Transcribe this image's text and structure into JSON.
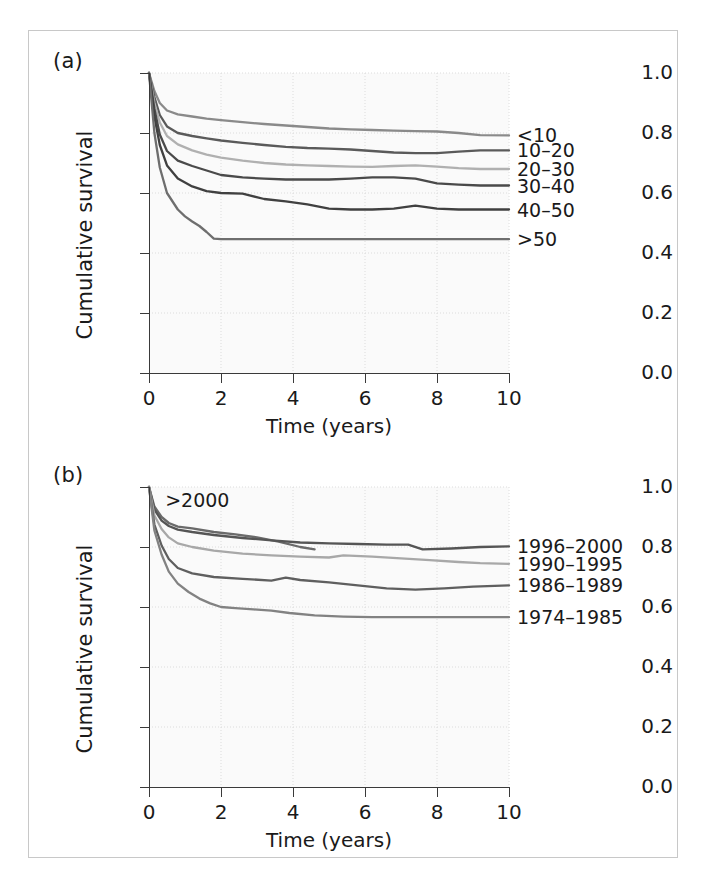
{
  "figure": {
    "panel_a_label": "(a)",
    "panel_b_label": "(b)"
  },
  "axes": {
    "xlabel": "Time (years)",
    "ylabel": "Cumulative survival",
    "xticks": [
      "0",
      "2",
      "4",
      "6",
      "8",
      "10"
    ],
    "yticks": [
      "0.0",
      "0.2",
      "0.4",
      "0.6",
      "0.8",
      "1.0"
    ]
  },
  "chart_data": [
    {
      "type": "line",
      "panel": "(a)",
      "title": "",
      "xlabel": "Time (years)",
      "ylabel": "Cumulative survival",
      "xlim": [
        0,
        10
      ],
      "ylim": [
        0.0,
        1.0
      ],
      "xticks": [
        0,
        2,
        4,
        6,
        8,
        10
      ],
      "yticks": [
        0.0,
        0.2,
        0.4,
        0.6,
        0.8,
        1.0
      ],
      "grid": true,
      "legend": "right-inline",
      "legend_entries": [
        "<10",
        "10–20",
        "20–30",
        "30–40",
        "40–50",
        ">50"
      ],
      "series": [
        {
          "name": "<10",
          "color": "#8a8a8a",
          "end_label": "<10",
          "x": [
            0,
            0.15,
            0.3,
            0.5,
            0.8,
            1.2,
            1.6,
            2.0,
            2.6,
            3.2,
            3.8,
            4.4,
            5.0,
            5.6,
            6.2,
            6.8,
            7.4,
            8.0,
            8.6,
            9.2,
            10.0
          ],
          "y": [
            1.0,
            0.94,
            0.9,
            0.875,
            0.862,
            0.855,
            0.848,
            0.843,
            0.836,
            0.83,
            0.825,
            0.82,
            0.815,
            0.812,
            0.81,
            0.808,
            0.806,
            0.805,
            0.8,
            0.793,
            0.792
          ]
        },
        {
          "name": "10–20",
          "color": "#5a5a5a",
          "end_label": "10–20",
          "x": [
            0,
            0.15,
            0.3,
            0.5,
            0.8,
            1.2,
            1.6,
            2.0,
            2.6,
            3.2,
            3.8,
            4.4,
            5.0,
            5.6,
            6.2,
            6.8,
            7.4,
            8.0,
            8.6,
            9.2,
            10.0
          ],
          "y": [
            1.0,
            0.92,
            0.86,
            0.822,
            0.8,
            0.79,
            0.782,
            0.775,
            0.767,
            0.76,
            0.754,
            0.75,
            0.748,
            0.745,
            0.74,
            0.735,
            0.733,
            0.733,
            0.738,
            0.742,
            0.742
          ]
        },
        {
          "name": "20–30",
          "color": "#b0b0b0",
          "end_label": "20–30",
          "x": [
            0,
            0.15,
            0.3,
            0.5,
            0.8,
            1.2,
            1.6,
            2.0,
            2.6,
            3.2,
            3.8,
            4.4,
            5.0,
            5.6,
            6.2,
            6.8,
            7.4,
            8.0,
            8.6,
            9.2,
            10.0
          ],
          "y": [
            1.0,
            0.9,
            0.835,
            0.79,
            0.762,
            0.742,
            0.728,
            0.718,
            0.708,
            0.7,
            0.695,
            0.692,
            0.69,
            0.688,
            0.687,
            0.69,
            0.692,
            0.688,
            0.683,
            0.68,
            0.68
          ]
        },
        {
          "name": "30–40",
          "color": "#4a4a4a",
          "end_label": "30–40",
          "x": [
            0,
            0.15,
            0.3,
            0.5,
            0.8,
            1.2,
            1.6,
            2.0,
            2.6,
            3.2,
            3.8,
            4.4,
            5.0,
            5.6,
            6.2,
            6.8,
            7.4,
            8.0,
            8.6,
            9.2,
            10.0
          ],
          "y": [
            1.0,
            0.88,
            0.795,
            0.74,
            0.708,
            0.69,
            0.675,
            0.66,
            0.652,
            0.648,
            0.645,
            0.645,
            0.645,
            0.648,
            0.652,
            0.652,
            0.648,
            0.632,
            0.628,
            0.625,
            0.625
          ]
        },
        {
          "name": "40–50",
          "color": "#404040",
          "end_label": "40–50",
          "x": [
            0,
            0.15,
            0.3,
            0.5,
            0.8,
            1.2,
            1.6,
            2.0,
            2.6,
            3.2,
            3.8,
            4.4,
            5.0,
            5.6,
            6.2,
            6.8,
            7.4,
            8.0,
            8.6,
            9.2,
            10.0
          ],
          "y": [
            1.0,
            0.855,
            0.76,
            0.692,
            0.648,
            0.622,
            0.606,
            0.6,
            0.598,
            0.58,
            0.572,
            0.562,
            0.548,
            0.545,
            0.545,
            0.548,
            0.558,
            0.548,
            0.545,
            0.545,
            0.545
          ]
        },
        {
          "name": ">50",
          "color": "#6e6e6e",
          "end_label": ">50",
          "x": [
            0,
            0.15,
            0.3,
            0.5,
            0.8,
            1.0,
            1.2,
            1.4,
            1.6,
            1.8,
            2.0,
            3.0,
            4.0,
            5.0,
            6.0,
            7.0,
            8.0,
            9.0,
            10.0
          ],
          "y": [
            1.0,
            0.8,
            0.685,
            0.6,
            0.545,
            0.522,
            0.505,
            0.49,
            0.47,
            0.448,
            0.446,
            0.446,
            0.446,
            0.446,
            0.446,
            0.446,
            0.446,
            0.446,
            0.446
          ]
        }
      ]
    },
    {
      "type": "line",
      "panel": "(b)",
      "title": "",
      "xlabel": "Time (years)",
      "ylabel": "Cumulative survival",
      "xlim": [
        0,
        10
      ],
      "ylim": [
        0.0,
        1.0
      ],
      "xticks": [
        0,
        2,
        4,
        6,
        8,
        10
      ],
      "yticks": [
        0.0,
        0.2,
        0.4,
        0.6,
        0.8,
        1.0
      ],
      "grid": true,
      "legend": "right-inline",
      "legend_entries": [
        ">2000",
        "1996–2000",
        "1990–1995",
        "1986–1989",
        "1974–1985"
      ],
      "series": [
        {
          "name": ">2000",
          "color": "#6a6a6a",
          "inline_label": ">2000",
          "x": [
            0,
            0.15,
            0.35,
            0.55,
            0.8,
            1.2,
            1.8,
            2.4,
            3.0,
            3.6,
            4.2,
            4.6
          ],
          "y": [
            1.0,
            0.935,
            0.9,
            0.88,
            0.868,
            0.862,
            0.85,
            0.842,
            0.832,
            0.818,
            0.8,
            0.792
          ]
        },
        {
          "name": "1996–2000",
          "color": "#555555",
          "end_label": "1996–2000",
          "x": [
            0,
            0.15,
            0.35,
            0.55,
            0.8,
            1.2,
            1.8,
            2.6,
            3.4,
            4.2,
            5.0,
            5.8,
            6.6,
            7.2,
            7.6,
            8.4,
            9.2,
            10.0
          ],
          "y": [
            1.0,
            0.925,
            0.888,
            0.87,
            0.858,
            0.85,
            0.84,
            0.83,
            0.822,
            0.815,
            0.812,
            0.81,
            0.808,
            0.808,
            0.792,
            0.795,
            0.8,
            0.802
          ]
        },
        {
          "name": "1990–1995",
          "color": "#a8a8a8",
          "end_label": "1990–1995",
          "x": [
            0,
            0.15,
            0.35,
            0.55,
            0.8,
            1.2,
            1.8,
            2.6,
            3.4,
            4.2,
            5.0,
            5.4,
            6.2,
            7.0,
            7.8,
            8.6,
            9.2,
            10.0
          ],
          "y": [
            1.0,
            0.905,
            0.86,
            0.832,
            0.812,
            0.8,
            0.788,
            0.778,
            0.772,
            0.768,
            0.765,
            0.772,
            0.768,
            0.762,
            0.756,
            0.75,
            0.746,
            0.744
          ]
        },
        {
          "name": "1986–1989",
          "color": "#5f5f5f",
          "end_label": "1986–1989",
          "x": [
            0,
            0.15,
            0.35,
            0.55,
            0.8,
            1.2,
            1.8,
            2.6,
            3.4,
            3.8,
            4.2,
            5.0,
            5.8,
            6.6,
            7.4,
            8.2,
            9.0,
            10.0
          ],
          "y": [
            1.0,
            0.875,
            0.805,
            0.76,
            0.73,
            0.712,
            0.7,
            0.694,
            0.688,
            0.698,
            0.69,
            0.682,
            0.672,
            0.662,
            0.658,
            0.662,
            0.668,
            0.672
          ]
        },
        {
          "name": "1974–1985",
          "color": "#828282",
          "end_label": "1974–1985",
          "x": [
            0,
            0.15,
            0.35,
            0.55,
            0.8,
            1.1,
            1.4,
            1.7,
            2.0,
            2.4,
            2.9,
            3.4,
            3.9,
            4.6,
            5.4,
            6.2,
            7.0,
            8.0,
            9.0,
            10.0
          ],
          "y": [
            1.0,
            0.855,
            0.775,
            0.718,
            0.678,
            0.65,
            0.628,
            0.612,
            0.6,
            0.596,
            0.592,
            0.588,
            0.58,
            0.572,
            0.568,
            0.566,
            0.566,
            0.566,
            0.566,
            0.566
          ]
        }
      ]
    }
  ]
}
